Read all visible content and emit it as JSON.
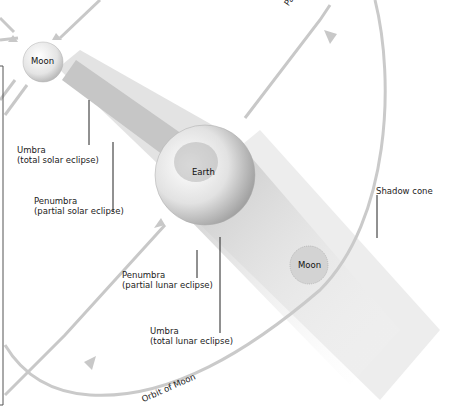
{
  "diagram": {
    "bodies": {
      "moon_top": "Moon",
      "earth": "Earth",
      "moon_bottom": "Moon"
    },
    "labels": {
      "umbra_solar": [
        "Umbra",
        "(total solar eclipse)"
      ],
      "penumbra_solar": [
        "Penumbra",
        "(partial solar eclipse)"
      ],
      "penumbra_lunar": [
        "Penumbra",
        "(partial lunar eclipse)"
      ],
      "umbra_lunar": [
        "Umbra",
        "(total lunar eclipse)"
      ],
      "shadow_cone": "Shadow cone",
      "path": "Path",
      "orbit_of_moon": "Orbit of Moon"
    },
    "colors": {
      "orbit_line": "#c8c8c8",
      "shadow_light": "#e6e6e6",
      "shadow_dark": "#bdbdbd",
      "leader_line": "#111111"
    }
  }
}
